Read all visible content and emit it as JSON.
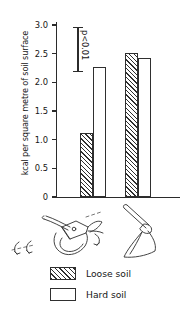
{
  "chart_data": {
    "type": "bar",
    "title": "",
    "xlabel": "",
    "ylabel": "kcal per square metre of soil surface",
    "ylim": [
      0,
      3.0
    ],
    "ytick_labels": [
      "0",
      "0.5",
      "1.0",
      "1.5",
      "2.0",
      "2.5",
      "3.0"
    ],
    "ytick_values": [
      0,
      0.5,
      1.0,
      1.5,
      2.0,
      2.5,
      3.0
    ],
    "grid": false,
    "legend_position": "below-plot",
    "categories": [
      "plough",
      "spade"
    ],
    "category_icons": [
      "plough-illustration",
      "spade-illustration"
    ],
    "series": [
      {
        "name": "Loose soil",
        "fill": "hatched",
        "values": [
          1.12,
          2.52
        ]
      },
      {
        "name": "Hard soil",
        "fill": "open",
        "values": [
          2.27,
          2.42
        ]
      }
    ],
    "annotations": [
      {
        "name": "significance-bar",
        "text": "p<0.01",
        "from": 2.97,
        "to": 2.18
      }
    ],
    "colors": {
      "ink": "#2b2b2b",
      "fill": "#ffffff"
    }
  },
  "axis": {
    "ylabel": "kcal per square metre of soil surface",
    "ticks": [
      {
        "label": "3.0",
        "value": 3.0
      },
      {
        "label": "2.5",
        "value": 2.5
      },
      {
        "label": "2.0",
        "value": 2.0
      },
      {
        "label": "1.5",
        "value": 1.5
      },
      {
        "label": "1.0",
        "value": 1.0
      },
      {
        "label": "0.5",
        "value": 0.5
      },
      {
        "label": "0",
        "value": 0
      }
    ]
  },
  "annotation": {
    "p_value_label": "p<0.01"
  },
  "legend": {
    "items": [
      {
        "label": "Loose soil",
        "fill": "hatched"
      },
      {
        "label": "Hard soil",
        "fill": "open"
      }
    ]
  }
}
